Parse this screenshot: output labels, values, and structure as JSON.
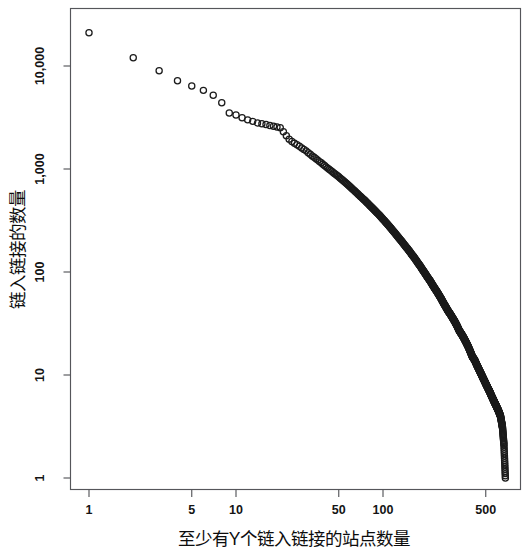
{
  "chart_data": {
    "type": "scatter",
    "title": "",
    "xlabel": "至少有Y个链入链接的站点数量",
    "ylabel": "链入链接的数量",
    "xscale": "log",
    "yscale": "log",
    "xlim": [
      1,
      760
    ],
    "ylim": [
      1,
      26000
    ],
    "grid": false,
    "legend": null,
    "marker": "open-circle",
    "marker_color": "#1b1b1b",
    "xticks": [
      1,
      5,
      10,
      50,
      100,
      500
    ],
    "xtick_labels": [
      "1",
      "5",
      "10",
      "50",
      "100",
      "500"
    ],
    "yticks": [
      1,
      10,
      100,
      1000,
      10000
    ],
    "ytick_labels": [
      "1",
      "10",
      "100",
      "1,000",
      "10,000"
    ],
    "series": [
      {
        "name": "inlinks",
        "x": [
          1,
          2,
          3,
          4,
          5,
          6,
          7,
          8,
          9,
          10,
          11,
          12,
          13,
          14,
          15,
          16,
          17,
          18,
          19,
          20,
          21,
          22,
          23,
          24,
          25,
          26,
          27,
          28,
          29,
          30,
          31,
          32,
          33,
          34,
          35,
          36,
          37,
          38,
          39,
          40,
          42,
          44,
          46,
          48,
          50,
          52,
          54,
          56,
          58,
          60,
          62,
          64,
          66,
          68,
          70,
          73,
          76,
          79,
          82,
          85,
          88,
          91,
          94,
          97,
          100,
          104,
          108,
          112,
          116,
          120,
          125,
          130,
          135,
          140,
          145,
          150,
          156,
          162,
          168,
          174,
          180,
          187,
          194,
          201,
          208,
          216,
          224,
          232,
          240,
          249,
          258,
          267,
          277,
          287,
          297,
          308,
          319,
          330,
          342,
          354,
          366,
          379,
          392,
          406,
          420,
          435,
          450,
          466,
          482,
          499,
          516,
          534,
          552,
          571,
          590,
          610,
          630,
          650,
          665,
          680
        ],
        "y": [
          21000,
          12000,
          9000,
          7200,
          6400,
          5800,
          5200,
          4400,
          3500,
          3350,
          3150,
          3000,
          2900,
          2800,
          2750,
          2700,
          2650,
          2600,
          2560,
          2520,
          2300,
          2100,
          1950,
          1850,
          1780,
          1720,
          1660,
          1600,
          1550,
          1500,
          1440,
          1390,
          1340,
          1300,
          1260,
          1220,
          1180,
          1150,
          1110,
          1080,
          1020,
          970,
          920,
          880,
          840,
          800,
          765,
          730,
          700,
          670,
          640,
          615,
          590,
          565,
          545,
          515,
          488,
          462,
          438,
          416,
          396,
          377,
          359,
          342,
          326,
          306,
          288,
          271,
          255,
          241,
          224,
          209,
          196,
          183,
          172,
          162,
          150,
          140,
          130,
          121,
          113,
          104,
          96,
          89,
          83,
          76,
          70,
          65,
          60,
          55,
          50,
          46,
          42,
          39,
          36,
          33,
          30,
          27,
          25,
          23,
          21,
          19,
          17,
          15,
          14,
          12.5,
          11.3,
          10.2,
          9.2,
          8.3,
          7.5,
          6.8,
          6.1,
          5.5,
          5.0,
          4.5,
          4.0,
          3.1,
          2.1,
          1.0
        ]
      }
    ]
  },
  "axes": {
    "ylabel_text": "链入链接的数量",
    "xlabel_text": "至少有Y个链入链接的站点数量"
  }
}
